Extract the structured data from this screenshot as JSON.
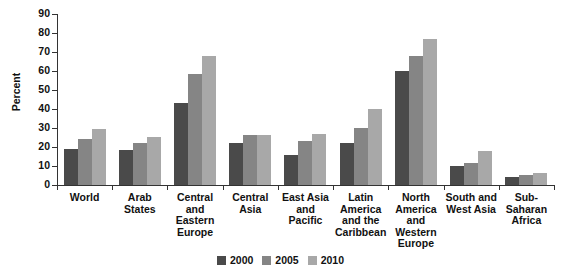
{
  "chart_data": {
    "type": "bar",
    "title": "",
    "subtitle": "",
    "xlabel": "",
    "ylabel": "Percent",
    "ylim": [
      0,
      90
    ],
    "ytick_step": 10,
    "yticks": [
      0,
      10,
      20,
      30,
      40,
      50,
      60,
      70,
      80,
      90
    ],
    "grid": false,
    "legend_position": "bottom-center",
    "categories": [
      "World",
      "Arab\nStates",
      "Central and\nEastern\nEurope",
      "Central\nAsia",
      "East Asia\nand\nPacific",
      "Latin\nAmerica\nand the\nCaribbean",
      "North\nAmerica\nand\nWestern\nEurope",
      "South and\nWest Asia",
      "Sub-\nSaharan\nAfrica"
    ],
    "series": [
      {
        "name": "2000",
        "color": "#4a4a4a",
        "values": [
          19,
          18.5,
          43,
          22,
          16,
          22,
          60,
          10,
          4
        ]
      },
      {
        "name": "2005",
        "color": "#858585",
        "values": [
          24,
          22,
          58.5,
          26.5,
          23,
          30,
          68,
          11.5,
          5.5
        ]
      },
      {
        "name": "2010",
        "color": "#a8a8a8",
        "values": [
          29.5,
          25.5,
          68,
          26.5,
          27,
          40,
          77,
          18,
          6.5
        ]
      }
    ]
  }
}
